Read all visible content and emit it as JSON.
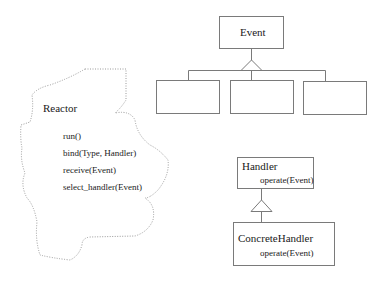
{
  "reactor": {
    "name": "Reactor",
    "methods": [
      "run()",
      "bind(Type, Handler)",
      "receive(Event)",
      "select_handler(Event)"
    ],
    "outline": "dotted"
  },
  "event": {
    "name": "Event",
    "subclasses": [
      "",
      "",
      ""
    ]
  },
  "handler": {
    "name": "Handler",
    "method": "operate(Event)"
  },
  "concrete_handler": {
    "name": "ConcreteHandler",
    "method": "operate(Event)"
  },
  "colors": {
    "line": "#7a7a7a",
    "dotted": "#9a9a9a",
    "text": "#1a1a1a"
  }
}
